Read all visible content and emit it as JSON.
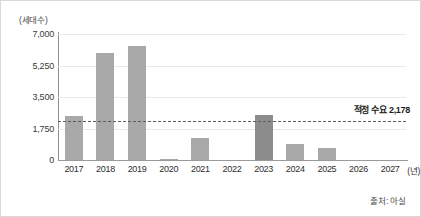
{
  "chart_data": {
    "type": "bar",
    "title": "",
    "unit_label": "(세대수)",
    "xlabel": "(년)",
    "ylabel": "",
    "categories": [
      "2017",
      "2018",
      "2019",
      "2020",
      "2021",
      "2022",
      "2023",
      "2024",
      "2025",
      "2026",
      "2027"
    ],
    "values": [
      2450,
      5950,
      6350,
      60,
      1200,
      0,
      2500,
      900,
      650,
      0,
      0
    ],
    "ylim": [
      0,
      7000
    ],
    "yticks": [
      0,
      1750,
      3500,
      5250,
      7000
    ],
    "ytick_labels": [
      "0",
      "1,750",
      "3,500",
      "5,250",
      "7,000"
    ],
    "grid": true,
    "legend": "none",
    "bar_color": "#a9a9a9",
    "highlight_color": "#8c8c8c",
    "highlight_category": "2023",
    "reference_line": {
      "value": 2178,
      "label": "적정 수요 2,178",
      "style": "dashed",
      "color": "#5d5d5d"
    },
    "source": "출처: 아실"
  }
}
